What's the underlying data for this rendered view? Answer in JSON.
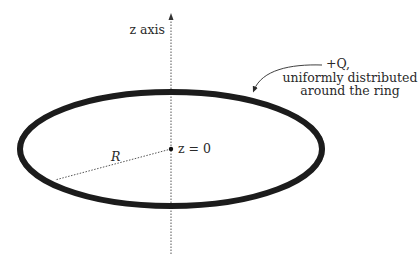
{
  "diagram": {
    "type": "physics-figure",
    "axis": {
      "label": "z axis",
      "x": 171,
      "top": 15,
      "bottom": 254,
      "style": "dotted",
      "arrow": "up"
    },
    "ring": {
      "cx": 171,
      "cy": 149,
      "rx": 151,
      "ry": 57,
      "stroke_width": 7,
      "color": "#1a1a1a"
    },
    "origin": {
      "label": "z = 0",
      "x": 171,
      "y": 149
    },
    "radius": {
      "label": "R",
      "from": [
        171,
        149
      ],
      "to": [
        55,
        180
      ],
      "style": "dotted"
    },
    "charge_annotation": {
      "lines": [
        "+Q,",
        "uniformly distributed",
        "around the ring"
      ],
      "arrow_from": [
        322,
        65
      ],
      "arrow_to": [
        253,
        92
      ]
    }
  }
}
